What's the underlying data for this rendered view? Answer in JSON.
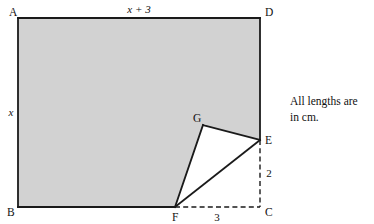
{
  "figure": {
    "caption": {
      "line1": "All lengths are",
      "line2": "in cm."
    },
    "colors": {
      "shaded_fill": "#d2d2d2",
      "cutout_fill": "#ffffff",
      "stroke": "#1a1a1a",
      "background": "#ffffff"
    },
    "vertices": [
      {
        "name": "A",
        "label": "A",
        "x": 18,
        "y": 18,
        "label_x": 9,
        "label_y": 16
      },
      {
        "name": "D",
        "label": "D",
        "x": 260,
        "y": 18,
        "label_x": 265,
        "label_y": 16
      },
      {
        "name": "B",
        "label": "B",
        "x": 18,
        "y": 207,
        "label_x": 7,
        "label_y": 216
      },
      {
        "name": "C",
        "label": "C",
        "x": 260,
        "y": 207,
        "label_x": 265,
        "label_y": 216
      },
      {
        "name": "E",
        "label": "E",
        "x": 260,
        "y": 140,
        "label_x": 265,
        "label_y": 144
      },
      {
        "name": "F",
        "label": "F",
        "x": 175,
        "y": 207,
        "label_x": 172,
        "label_y": 221
      },
      {
        "name": "G",
        "label": "G",
        "x": 203,
        "y": 125,
        "label_x": 193,
        "label_y": 122
      }
    ],
    "dimensions": [
      {
        "name": "top-length",
        "label": "x + 3",
        "italic": true,
        "x": 139,
        "y": 13,
        "anchor": "middle"
      },
      {
        "name": "left-height",
        "label": "x",
        "italic": true,
        "x": 11,
        "y": 116,
        "anchor": "middle"
      },
      {
        "name": "right-segment",
        "label": "2",
        "italic": false,
        "x": 269,
        "y": 177,
        "anchor": "middle"
      },
      {
        "name": "bottom-segment",
        "label": "3",
        "italic": false,
        "x": 217,
        "y": 221,
        "anchor": "middle"
      }
    ],
    "shaded_region_path": "M 18,18 L 260,18 L 260,140 L 203,125 L 175,207 L 18,207 Z",
    "cutout_triangle_path": "M 175,207 L 203,125 L 260,140 Z",
    "solid_edges": [
      {
        "name": "edge-AD",
        "x1": 18,
        "y1": 18,
        "x2": 260,
        "y2": 18
      },
      {
        "name": "edge-AB",
        "x1": 18,
        "y1": 18,
        "x2": 18,
        "y2": 207
      },
      {
        "name": "edge-BF",
        "x1": 18,
        "y1": 207,
        "x2": 175,
        "y2": 207
      },
      {
        "name": "edge-DE",
        "x1": 260,
        "y1": 18,
        "x2": 260,
        "y2": 140
      },
      {
        "name": "edge-FG",
        "x1": 175,
        "y1": 207,
        "x2": 203,
        "y2": 125
      },
      {
        "name": "edge-GE",
        "x1": 203,
        "y1": 125,
        "x2": 260,
        "y2": 140
      },
      {
        "name": "edge-FE",
        "x1": 175,
        "y1": 207,
        "x2": 260,
        "y2": 140
      }
    ],
    "dashed_edges": [
      {
        "name": "edge-FC",
        "x1": 175,
        "y1": 207,
        "x2": 260,
        "y2": 207
      },
      {
        "name": "edge-EC",
        "x1": 260,
        "y1": 140,
        "x2": 260,
        "y2": 207
      }
    ],
    "caption_position": {
      "x": 290,
      "y1": 105,
      "y2": 121
    }
  }
}
